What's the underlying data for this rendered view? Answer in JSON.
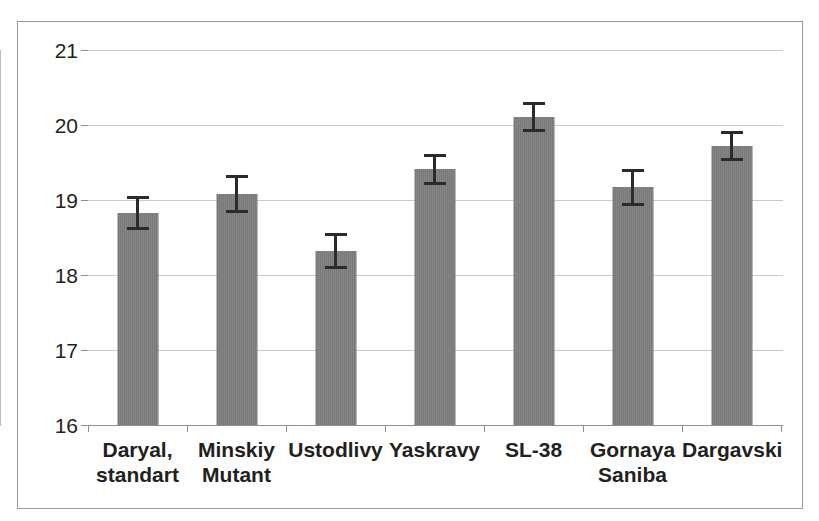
{
  "chart_data": {
    "type": "bar",
    "title": "",
    "subtitle": "",
    "xlabel": "",
    "ylabel": "",
    "categories": [
      "Daryal, standart",
      "Minskiy Mutant",
      "Ustodlivy",
      "Yaskravy",
      "SL-38",
      "Gornaya Saniba",
      "Dargavski"
    ],
    "category_lines": [
      [
        "Daryal,",
        "standart"
      ],
      [
        "Minskiy",
        "Mutant"
      ],
      [
        "Ustodlivy"
      ],
      [
        "Yaskravy"
      ],
      [
        "SL-38"
      ],
      [
        "Gornaya",
        "Saniba"
      ],
      [
        "Dargavski"
      ]
    ],
    "values": [
      18.83,
      19.08,
      18.32,
      19.41,
      20.11,
      19.17,
      19.72
    ],
    "errors": [
      0.23,
      0.25,
      0.24,
      0.21,
      0.2,
      0.25,
      0.2
    ],
    "error_low": [
      18.6,
      18.83,
      18.08,
      19.2,
      19.91,
      18.92,
      19.52
    ],
    "error_high": [
      19.06,
      19.33,
      18.56,
      19.62,
      20.31,
      19.42,
      19.92
    ],
    "ylim": [
      16,
      21
    ],
    "yticks": [
      16,
      17,
      18,
      19,
      20,
      21
    ],
    "ytick_labels": [
      "16",
      "17",
      "18",
      "19",
      "20",
      "21"
    ],
    "grid": true,
    "grid_axis": "y",
    "legend": false,
    "legend_position": "none",
    "bar_color": "#808080",
    "error_color": "#2b2b2b",
    "gridline_color": "#c9c9c9",
    "axis_color": "#8f8f8f",
    "frame_color": "#9a9a9a",
    "text_color": "#231f20",
    "background": "#ffffff"
  }
}
